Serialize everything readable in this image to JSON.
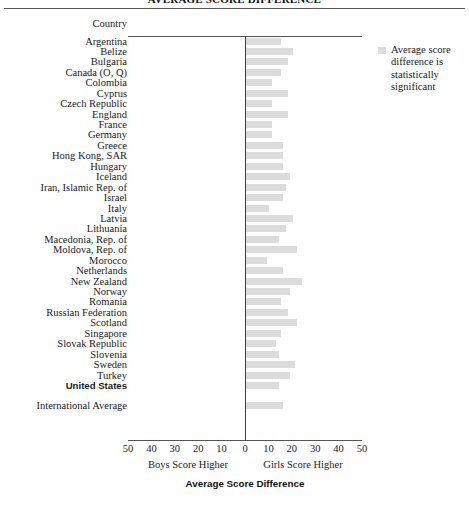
{
  "figure": {
    "cutoff_title": "AVERAGE SCORE DIFFERENCE",
    "column_header": "Country",
    "axis_title": "Average Score Difference",
    "left_direction_label": "Boys Score Higher",
    "right_direction_label": "Girls Score Higher",
    "bar_color": "#dcdcdc",
    "axis_color": "#3d3d3d"
  },
  "legend": {
    "swatch_name": "legend-swatch",
    "text": "Average score difference is statistically significant"
  },
  "chart_data": {
    "type": "bar",
    "orientation": "horizontal",
    "title": "AVERAGE SCORE DIFFERENCE",
    "xlabel": "Average Score Difference",
    "ylabel": "Country",
    "xlim": [
      -50,
      50
    ],
    "xticks": [
      -50,
      -40,
      -30,
      -20,
      -10,
      0,
      10,
      20,
      30,
      40,
      50
    ],
    "xtick_labels": [
      "50",
      "40",
      "30",
      "20",
      "10",
      "0",
      "10",
      "20",
      "30",
      "40",
      "50"
    ],
    "grid": false,
    "legend_position": "right",
    "note_left": "Boys Score Higher",
    "note_right": "Girls Score Higher",
    "categories": [
      "Argentina",
      "Belize",
      "Bulgaria",
      "Canada (O, Q)",
      "Colombia",
      "Cyprus",
      "Czech Republic",
      "England",
      "France",
      "Germany",
      "Greece",
      "Hong Kong, SAR",
      "Hungary",
      "Iceland",
      "Iran, Islamic Rep. of",
      "Israel",
      "Italy",
      "Latvia",
      "Lithuania",
      "Macedonia, Rep. of",
      "Moldova, Rep. of",
      "Morocco",
      "Netherlands",
      "New Zealand",
      "Norway",
      "Romania",
      "Russian Federation",
      "Scotland",
      "Singapore",
      "Slovak Republic",
      "Slovenia",
      "Sweden",
      "Turkey",
      "United States"
    ],
    "values": [
      15,
      20,
      18,
      15,
      11,
      18,
      11,
      18,
      11,
      11,
      16,
      16,
      16,
      19,
      17,
      16,
      10,
      20,
      17,
      14,
      22,
      9,
      16,
      24,
      19,
      15,
      18,
      22,
      15,
      13,
      14,
      21,
      19,
      14
    ],
    "summary": {
      "label": "International Average",
      "value": 16
    },
    "bold_categories": [
      "United States"
    ]
  }
}
